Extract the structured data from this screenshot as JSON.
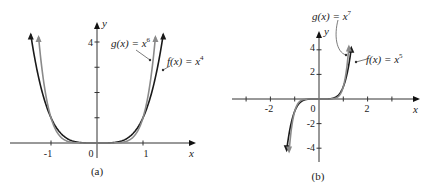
{
  "chart_data": [
    {
      "type": "line",
      "panel": "(a)",
      "caption": "(a)",
      "xlabel": "x",
      "ylabel": "y",
      "xlim": [
        -1.8,
        2.0
      ],
      "ylim": [
        0,
        4.4
      ],
      "x_ticks": [
        -1,
        0,
        1
      ],
      "x_tick_labels": [
        "-1",
        "0",
        "1"
      ],
      "y_ticks": [
        1,
        2,
        3,
        4
      ],
      "y_tick_labels": [
        "",
        "",
        "",
        "4"
      ],
      "grid": false,
      "series": [
        {
          "name": "f(x) = x^4",
          "label_func": "f(x) = x",
          "exponent": 4,
          "color": "#1a1a1a",
          "x": [
            -1.44,
            -1.2,
            -1.0,
            -0.8,
            -0.6,
            -0.4,
            -0.2,
            0,
            0.2,
            0.4,
            0.6,
            0.8,
            1.0,
            1.2,
            1.44
          ],
          "values": [
            4.3,
            2.07,
            1.0,
            0.41,
            0.13,
            0.026,
            0.0016,
            0,
            0.0016,
            0.026,
            0.13,
            0.41,
            1.0,
            2.07,
            4.3
          ]
        },
        {
          "name": "g(x) = x^6",
          "label_func": "g(x) = x",
          "exponent": 6,
          "color": "#8a8a8a",
          "x": [
            -1.27,
            -1.2,
            -1.0,
            -0.8,
            -0.6,
            -0.4,
            -0.2,
            0,
            0.2,
            0.4,
            0.6,
            0.8,
            1.0,
            1.2,
            1.27
          ],
          "values": [
            4.2,
            2.99,
            1.0,
            0.26,
            0.047,
            0.004,
            0.0001,
            0,
            0.0001,
            0.004,
            0.047,
            0.26,
            1.0,
            2.99,
            4.2
          ]
        }
      ],
      "annotations": [
        "g(x) = x^6",
        "f(x) = x^4"
      ]
    },
    {
      "type": "line",
      "panel": "(b)",
      "caption": "(b)",
      "xlabel": "x",
      "ylabel": "y",
      "xlim": [
        -3.6,
        4.0
      ],
      "ylim": [
        -5,
        5.5
      ],
      "x_ticks": [
        -3,
        -2,
        -1,
        0,
        1,
        2,
        3
      ],
      "x_tick_labels": [
        "",
        "-2",
        "",
        "0",
        "",
        "2",
        ""
      ],
      "y_ticks": [
        -4,
        -2,
        2,
        4
      ],
      "y_tick_labels": [
        "-4",
        "-2",
        "2",
        "4"
      ],
      "grid": false,
      "series": [
        {
          "name": "f(x) = x^5",
          "label_func": "f(x) = x",
          "exponent": 5,
          "color": "#1a1a1a",
          "x": [
            -1.33,
            -1.2,
            -1.0,
            -0.8,
            -0.6,
            -0.4,
            -0.2,
            0,
            0.2,
            0.4,
            0.6,
            0.8,
            1.0,
            1.2,
            1.33
          ],
          "values": [
            -4.2,
            -2.49,
            -1.0,
            -0.33,
            -0.078,
            -0.01,
            -0.0003,
            0,
            0.0003,
            0.01,
            0.078,
            0.33,
            1.0,
            2.49,
            4.2
          ]
        },
        {
          "name": "g(x) = x^7",
          "label_func": "g(x) = x",
          "exponent": 7,
          "color": "#8a8a8a",
          "x": [
            -1.23,
            -1.1,
            -1.0,
            -0.8,
            -0.6,
            -0.4,
            -0.2,
            0,
            0.2,
            0.4,
            0.6,
            0.8,
            1.0,
            1.1,
            1.23
          ],
          "values": [
            -4.3,
            -1.95,
            -1.0,
            -0.21,
            -0.028,
            -0.0016,
            0,
            0,
            0,
            0.0016,
            0.028,
            0.21,
            1.0,
            1.95,
            4.3
          ]
        }
      ],
      "annotations": [
        "g(x) = x^7",
        "f(x) = x^5"
      ]
    }
  ],
  "panel_a": {
    "caption": "(a)",
    "xlabel": "x",
    "ylabel": "y",
    "x_tick_labels": {
      "neg1": "-1",
      "zero": "0",
      "one": "1"
    },
    "y_tick_label_4": "4",
    "label_g": {
      "func": "g(x) = x",
      "exp": "6"
    },
    "label_f": {
      "func": "f(x) = x",
      "exp": "4"
    }
  },
  "panel_b": {
    "caption": "(b)",
    "xlabel": "x",
    "ylabel": "y",
    "x_tick_labels": {
      "neg2": "-2",
      "zero": "0",
      "two": "2"
    },
    "y_tick_labels": {
      "four": "4",
      "two": "2",
      "neg2": "-2",
      "neg4": "-4"
    },
    "label_g": {
      "func": "g(x) = x",
      "exp": "7"
    },
    "label_f": {
      "func": "f(x) = x",
      "exp": "5"
    }
  },
  "colors": {
    "f_curve": "#1a1a1a",
    "g_curve": "#8a8a8a",
    "axis": "#333333"
  }
}
